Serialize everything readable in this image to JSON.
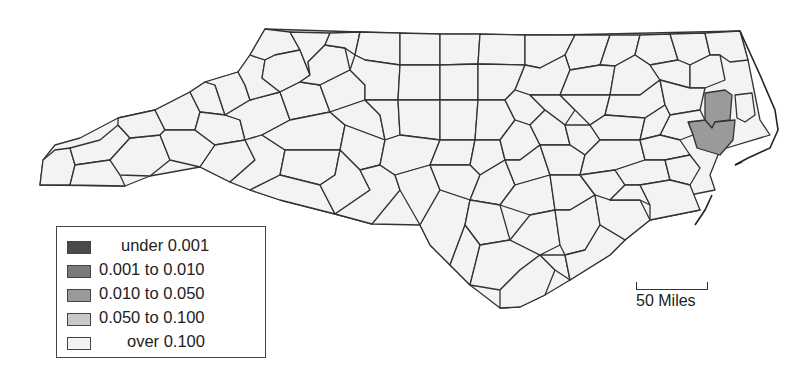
{
  "map": {
    "region": "North Carolina counties",
    "highlighted_region_class": "0.010 to 0.050",
    "colors": {
      "under_0_001": "#4a4a4a",
      "0_001_to_0_010": "#7a7a7a",
      "0_010_to_0_050": "#9a9a9a",
      "0_050_to_0_100": "#c8c8c8",
      "over_0_100": "#f3f3f3",
      "border": "#333333"
    }
  },
  "legend": {
    "items": [
      {
        "label": "under 0.001",
        "color": "#4a4a4a"
      },
      {
        "label": "0.001 to 0.010",
        "color": "#7a7a7a"
      },
      {
        "label": "0.010 to 0.050",
        "color": "#9a9a9a"
      },
      {
        "label": "0.050 to 0.100",
        "color": "#c8c8c8"
      },
      {
        "label": "over 0.100",
        "color": "#f3f3f3"
      }
    ]
  },
  "scale": {
    "label": "50 Miles"
  }
}
